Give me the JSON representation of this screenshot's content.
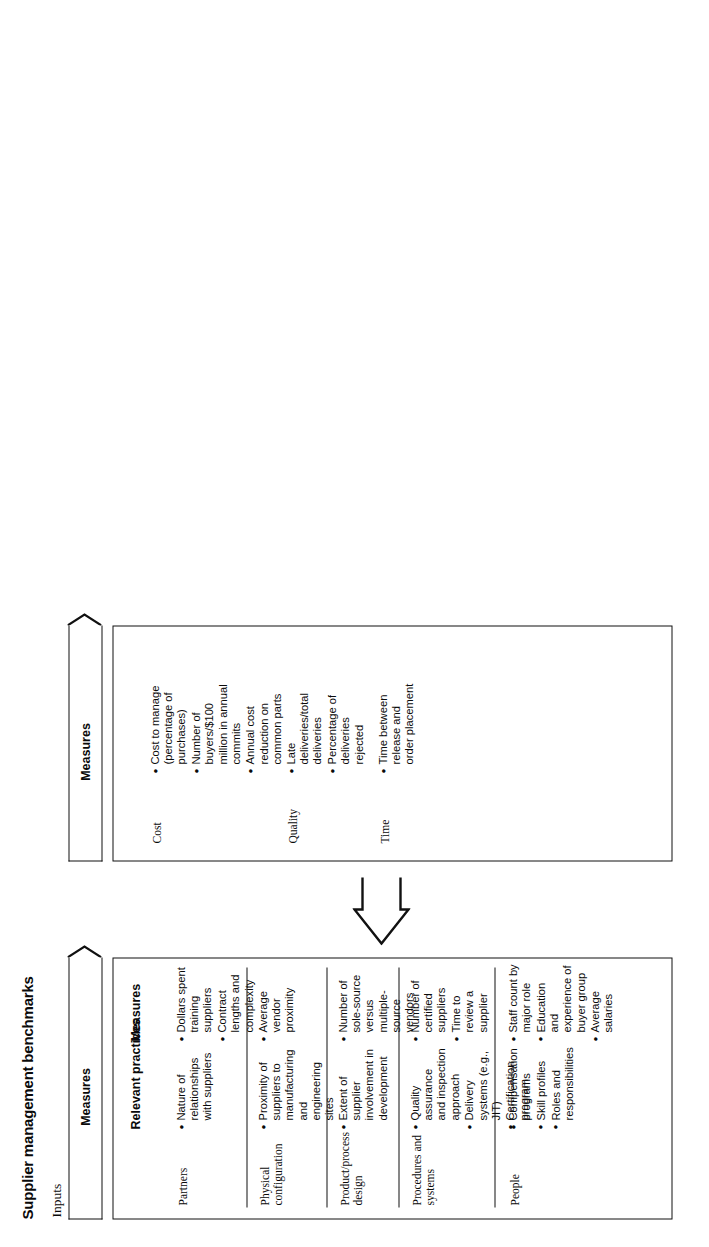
{
  "figure": {
    "title": "Supplier management benchmarks",
    "bands": {
      "inputs_label": "Inputs",
      "outputs_label": "Outputs"
    },
    "banners": {
      "inputs_banner": "Measures",
      "outputs_banner": "Measures"
    },
    "columns": {
      "relevant_practices": "Relevant practices",
      "measures": "Measures"
    }
  },
  "inputs": {
    "rows": [
      {
        "label": "Partners",
        "practices": [
          "Nature of relationships with suppliers"
        ],
        "measures": [
          "Dollars spent training suppliers",
          "Contract lengths and complexity"
        ]
      },
      {
        "label": "Physical configuration",
        "practices": [
          "Proximity of suppliers to manufacturing and engineering sites"
        ],
        "measures": [
          "Average vendor proximity"
        ]
      },
      {
        "label": "Product/process design",
        "practices": [
          "Extent of supplier involvement in development"
        ],
        "measures": [
          "Number of sole-source versus multiple-source vendors"
        ]
      },
      {
        "label": "Procedures and systems",
        "practices": [
          "Quality assurance and inspection approach",
          "Delivery systems (e.g., JIT)",
          "Certification program"
        ],
        "measures": [
          "Number of certified suppliers",
          "Time to review a supplier"
        ]
      },
      {
        "label": "People",
        "practices": [
          "Compensation programs",
          "Skill profiles",
          "Roles and responsibilities"
        ],
        "measures": [
          "Staff count by major role",
          "Education and experience of buyer group",
          "Average salaries"
        ]
      }
    ]
  },
  "outputs": {
    "rows": [
      {
        "label": "Cost",
        "measures": [
          "Cost to manage (percentage of purchases)",
          "Number of buyers/$100 million in annual commits",
          "Annual cost reduction on common parts"
        ]
      },
      {
        "label": "Quality",
        "measures": [
          "Late deliveries/total deliveries",
          "Percentage of deliveries rejected"
        ]
      },
      {
        "label": "Time",
        "measures": [
          "Time between release and order placement"
        ]
      }
    ]
  },
  "colors": {
    "ink": "#111111",
    "paper": "#ffffff"
  }
}
